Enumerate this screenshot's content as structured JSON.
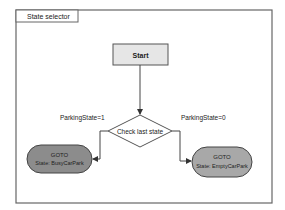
{
  "frame": {
    "title": "State selector"
  },
  "nodes": {
    "start": {
      "label": "Start",
      "fill": "#e6e6e6"
    },
    "decision": {
      "label": "Check last state"
    },
    "goto_left": {
      "line1": "GOTO",
      "line2": "State: BusyCarPark",
      "fill": "#8c8c8c"
    },
    "goto_right": {
      "line1": "GOTO",
      "line2": "State: EmptyCarPark",
      "fill": "#a8a8a8"
    }
  },
  "edges": {
    "left_condition": "ParkingState=1",
    "right_condition": "ParkingState=0"
  },
  "colors": {
    "stroke": "#555555",
    "frame": "#666666",
    "background": "#ffffff"
  }
}
